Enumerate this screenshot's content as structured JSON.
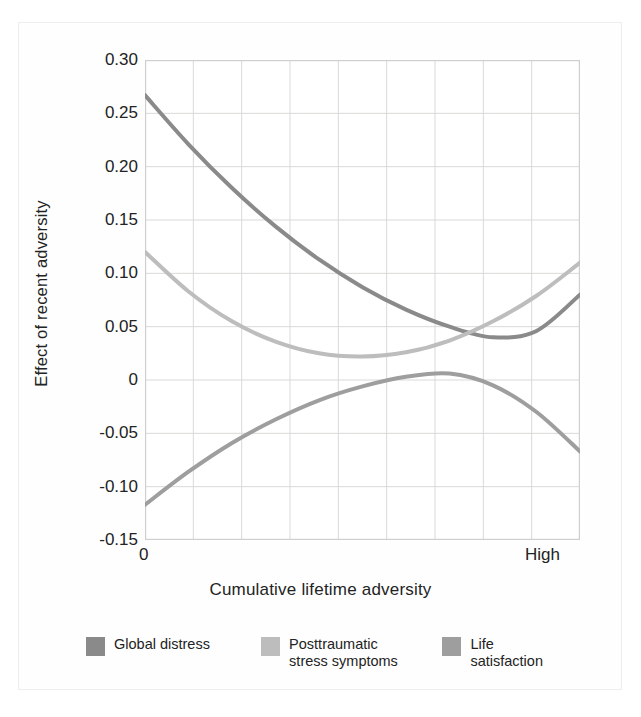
{
  "chart_data": {
    "type": "line",
    "title": "",
    "xlabel": "Cumulative lifetime adversity",
    "ylabel": "Effect of recent adversity",
    "xlim": [
      0,
      1
    ],
    "ylim": [
      -0.15,
      0.3
    ],
    "grid": true,
    "legend_position": "bottom",
    "x_tick_labels": [
      "0",
      "High"
    ],
    "y_tick_labels": [
      "0.30",
      "0.25",
      "0.20",
      "0.15",
      "0.10",
      "0.05",
      "0",
      "-0.05",
      "-0.10",
      "-0.15"
    ],
    "y_tick_values": [
      0.3,
      0.25,
      0.2,
      0.15,
      0.1,
      0.05,
      0,
      -0.05,
      -0.1,
      -0.15
    ],
    "x_gridline_count": 8,
    "x": [
      0,
      0.1,
      0.2,
      0.3,
      0.4,
      0.5,
      0.6,
      0.7,
      0.8,
      0.9,
      1.0
    ],
    "series": [
      {
        "name": "Global distress",
        "color": "#8a8a8a",
        "values": [
          0.267,
          0.221,
          0.18,
          0.144,
          0.113,
          0.087,
          0.066,
          0.05,
          0.04,
          0.046,
          0.08
        ]
      },
      {
        "name": "Posttraumatic\nstress symptoms",
        "color": "#bdbdbd",
        "values": [
          0.12,
          0.083,
          0.055,
          0.036,
          0.025,
          0.022,
          0.026,
          0.037,
          0.055,
          0.079,
          0.11
        ]
      },
      {
        "name": "Life satisfaction",
        "color": "#9e9e9e",
        "values": [
          -0.117,
          -0.086,
          -0.059,
          -0.037,
          -0.019,
          -0.006,
          0.003,
          0.006,
          -0.005,
          -0.03,
          -0.067
        ]
      }
    ]
  },
  "legend": {
    "items": [
      {
        "label": "Global distress",
        "color": "#8a8a8a"
      },
      {
        "label": "Posttraumatic\nstress symptoms",
        "color": "#bdbdbd"
      },
      {
        "label": "Life satisfaction",
        "color": "#9e9e9e"
      }
    ]
  },
  "axes": {
    "y_title": "Effect of recent adversity",
    "x_title": "Cumulative lifetime adversity",
    "x_left": "0",
    "x_right": "High"
  }
}
